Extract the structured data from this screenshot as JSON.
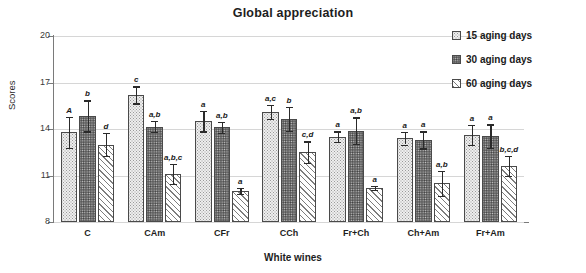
{
  "chart_data": {
    "type": "bar",
    "title": "Global appreciation",
    "xlabel": "White wines",
    "ylabel": "Scores",
    "ylim": [
      8,
      20
    ],
    "yticks": [
      8,
      11,
      14,
      17,
      20
    ],
    "grid": true,
    "legend_position": "right",
    "categories": [
      "C",
      "CAm",
      "CFr",
      "CCh",
      "Fr+Ch",
      "Ch+Am",
      "Fr+Am"
    ],
    "series": [
      {
        "name": "15 aging days",
        "values": [
          13.8,
          16.2,
          14.5,
          15.1,
          13.5,
          13.4,
          13.6
        ],
        "errors": [
          1.0,
          0.55,
          0.65,
          0.45,
          0.35,
          0.4,
          0.65
        ]
      },
      {
        "name": "30 aging days",
        "values": [
          14.85,
          14.15,
          14.1,
          14.65,
          13.9,
          13.3,
          13.55
        ],
        "errors": [
          1.0,
          0.35,
          0.35,
          0.75,
          0.85,
          0.55,
          0.75
        ]
      },
      {
        "name": "60 aging days",
        "values": [
          13.0,
          11.1,
          10.0,
          12.5,
          10.2,
          10.5,
          11.6
        ],
        "errors": [
          0.75,
          0.65,
          0.2,
          0.7,
          0.15,
          0.8,
          0.65
        ]
      }
    ],
    "annotations": [
      [
        "A",
        "b",
        "d"
      ],
      [
        "c",
        "a,b",
        "a,b,c"
      ],
      [
        "a",
        "a,b",
        "a"
      ],
      [
        "a,c",
        "b",
        "c,d"
      ],
      [
        "a",
        "a,b",
        "a"
      ],
      [
        "a",
        "a",
        "a,b"
      ],
      [
        "a",
        "a",
        "b,c,d"
      ]
    ]
  },
  "legend": {
    "items": [
      {
        "label": "15 aging days",
        "pattern": "light-dotted"
      },
      {
        "label": "30 aging days",
        "pattern": "dark-dotted"
      },
      {
        "label": "60 aging days",
        "pattern": "diagonal-hatch"
      }
    ]
  }
}
